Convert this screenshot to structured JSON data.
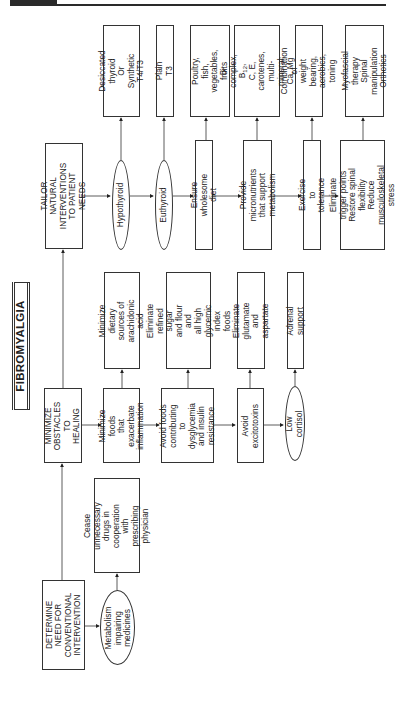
{
  "header": {
    "bar_color": "#2a2a2a"
  },
  "title": "FIBROMYALGIA",
  "columns": {
    "conventional": {
      "heading": "DETERMINE\nNEED FOR\nCONVENTIONAL\nINTERVENTION",
      "condition": "Metabolism\nimpairing\nmedicines",
      "action": "Cease unnecessary\ndrugs in cooperation\nwith prescribing\nphysician"
    },
    "obstacles": {
      "heading": "MINIMIZE\nOBSTACLES\nTO HEALING",
      "steps": [
        {
          "label": "Minimize foods\nthat exacerbate\ninflammation",
          "detail": "Minimize dietary\nsources of\narachidonic acid"
        },
        {
          "label": "Avoid foods\ncontributing to\ndysglycemia\nand insulin\nresistance",
          "detail": "Eliminate refined\nsugar and flour and\nall high glycemic\nindex foods"
        },
        {
          "label": "Avoid\nexcitotoxins",
          "detail": "Eliminate glutamate\nand aspartate"
        },
        {
          "label": "Low cortisol",
          "detail": "Adrenal support"
        }
      ]
    },
    "natural": {
      "heading": "TAILOR NATURAL\nINTERVENTIONS\nTO PATIENT NEEDS",
      "steps": [
        {
          "label": "Hypothyroid",
          "detail": "Desiccated thyroid\nOr\nSynthetic T4/T3"
        },
        {
          "label": "Euthyroid",
          "detail": "Plain T3"
        },
        {
          "label": "Ensure wholesome diet",
          "detail": "Poultry, fish,\nvegetables, fruits"
        },
        {
          "label": "Provide micronutrients\nthat support metabolism",
          "detail_parts": [
            "B-complex, B",
            "12",
            ",\nC, E, carotenes,\nmulti-mineral,\nCa, Mg"
          ]
        },
        {
          "label": "Exercise to tolerance",
          "detail": "Combination of\nweight bearing,\naerobics, toning"
        },
        {
          "label": "Eliminate trigger points\nRestore spinal flexibility\nReduce musculoskeletal\nstress",
          "detail": "Myofascial therapy\nSpinal manipulation\nOrthotics"
        }
      ]
    }
  }
}
